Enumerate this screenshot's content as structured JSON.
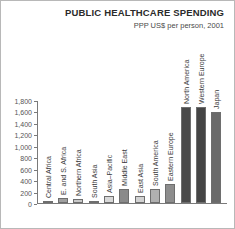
{
  "chart_data": {
    "type": "bar",
    "title": "PUBLIC HEALTHCARE SPENDING",
    "subtitle": "PPP US$ per person, 2001",
    "xlabel": "",
    "ylabel": "",
    "ylim": [
      0,
      1800
    ],
    "grid": false,
    "legend": "none",
    "ytick_labels": [
      "1,800",
      "1,600",
      "1,400",
      "1,200",
      "1,000",
      "800",
      "600",
      "400",
      "200",
      "0"
    ],
    "ytick_values": [
      1800,
      1600,
      1400,
      1200,
      1000,
      800,
      600,
      400,
      200,
      0
    ],
    "categories": [
      "Central Africa",
      "E. and S. Africa",
      "Northern Africa",
      "South Asia",
      "Asia–Pacific",
      "Middle East",
      "East Asia",
      "South America",
      "Eastern Europe",
      "North America",
      "Western Europe",
      "Japan"
    ],
    "values": [
      30,
      90,
      70,
      30,
      130,
      250,
      120,
      250,
      330,
      1700,
      1700,
      1600
    ],
    "bar_colors": [
      "#a6a6a6",
      "#a0a0a0",
      "#c9c9c9",
      "#cfcfcf",
      "#d8d8d8",
      "#8a8a8a",
      "#d2d2d2",
      "#b0b0b0",
      "#8d8d8d",
      "#4a4a4a",
      "#454545",
      "#6a6a6a"
    ]
  }
}
